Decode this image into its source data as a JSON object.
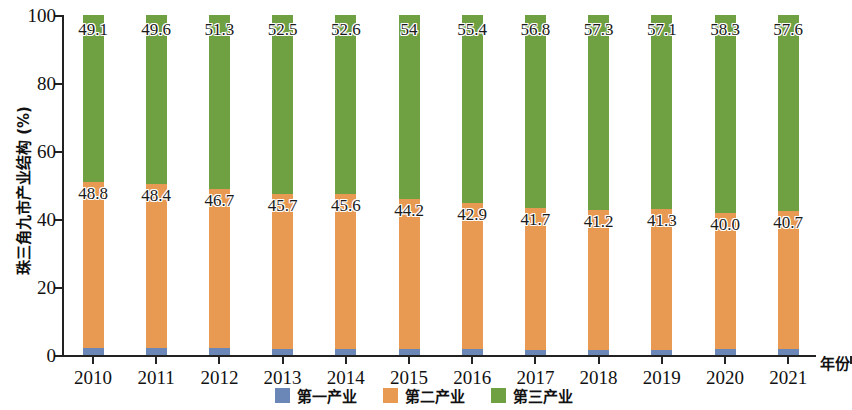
{
  "chart_data": {
    "type": "bar",
    "subtype": "stacked-percentage-column",
    "title": "",
    "xlabel": "年份",
    "ylabel": "珠三角九市产业结构 (%)",
    "ylim": [
      0,
      100
    ],
    "yticks": [
      0,
      20,
      40,
      60,
      80,
      100
    ],
    "ytick_labels": [
      "0",
      "20",
      "40",
      "60",
      "80",
      "100"
    ],
    "grid": false,
    "legend_position": "bottom-center",
    "categories": [
      "2010",
      "2011",
      "2012",
      "2013",
      "2014",
      "2015",
      "2016",
      "2017",
      "2018",
      "2019",
      "2020",
      "2021"
    ],
    "series": [
      {
        "name": "第一产业",
        "color": "#6b87b8",
        "values": [
          2.1,
          2.0,
          2.0,
          1.8,
          1.8,
          1.8,
          1.7,
          1.5,
          1.5,
          1.6,
          1.7,
          1.7
        ],
        "labels_shown": false
      },
      {
        "name": "第二产业",
        "color": "#e89a52",
        "values": [
          48.8,
          48.4,
          46.7,
          45.7,
          45.6,
          44.2,
          42.9,
          41.7,
          41.2,
          41.3,
          40.0,
          40.7
        ],
        "labels": [
          "48.8",
          "48.4",
          "46.7",
          "45.7",
          "45.6",
          "44.2",
          "42.9",
          "41.7",
          "41.2",
          "41.3",
          "40.0",
          "40.7"
        ],
        "labels_shown": true
      },
      {
        "name": "第三产业",
        "color": "#6fa042",
        "values": [
          49.1,
          49.6,
          51.3,
          52.5,
          52.6,
          54.0,
          55.4,
          56.8,
          57.3,
          57.1,
          58.3,
          57.6
        ],
        "labels": [
          "49.1",
          "49.6",
          "51.3",
          "52.5",
          "52.6",
          "54",
          "55.4",
          "56.8",
          "57.3",
          "57.1",
          "58.3",
          "57.6"
        ],
        "labels_shown": true
      }
    ]
  },
  "axes": {
    "y_title": "珠三角九市产业结构 (%)",
    "x_title": "年份",
    "ytick_labels": [
      "0",
      "20",
      "40",
      "60",
      "80",
      "100"
    ],
    "xtick_labels": [
      "2010",
      "2011",
      "2012",
      "2013",
      "2014",
      "2015",
      "2016",
      "2017",
      "2018",
      "2019",
      "2020",
      "2021"
    ]
  },
  "legend": {
    "items": [
      {
        "label": "第一产业",
        "color": "#6b87b8"
      },
      {
        "label": "第二产业",
        "color": "#e89a52"
      },
      {
        "label": "第三产业",
        "color": "#6fa042"
      }
    ]
  },
  "colors": {
    "primary_industry": "#6b87b8",
    "secondary_industry": "#e89a52",
    "tertiary_industry": "#6fa042",
    "axis": "#222222",
    "text": "#111111",
    "background": "#ffffff"
  }
}
